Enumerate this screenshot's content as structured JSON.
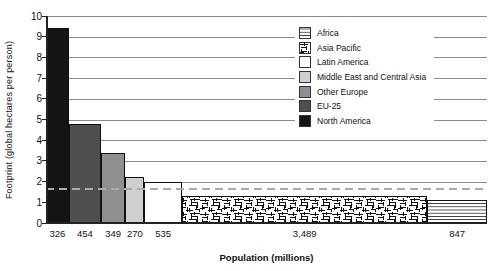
{
  "chart_data": {
    "type": "bar",
    "variant": "variable-width-bars",
    "xlabel": "Population (millions)",
    "ylabel": "Footprint (global hectares per person)",
    "ylim": [
      0,
      10
    ],
    "ytick_interval": 1,
    "grid": "horizontal",
    "legend_position": "top-right-inside",
    "reference_line": {
      "value": 1.7,
      "style": "dashed",
      "color": "#aaaaaa"
    },
    "axis_color": "#222222",
    "gridline_color": "#8c8c8c",
    "bar_border_color": "#111111",
    "series": [
      {
        "region": "North America",
        "population_millions": 326,
        "population_label": "326",
        "footprint_gha_per_person": 9.4,
        "fill": "#141414",
        "pattern": "solid"
      },
      {
        "region": "EU-25",
        "population_millions": 454,
        "population_label": "454",
        "footprint_gha_per_person": 4.8,
        "fill": "#4f4f4f",
        "pattern": "solid"
      },
      {
        "region": "Other Europe",
        "population_millions": 349,
        "population_label": "349",
        "footprint_gha_per_person": 3.4,
        "fill": "#8f8f8f",
        "pattern": "solid"
      },
      {
        "region": "Middle East and Central Asia",
        "population_millions": 270,
        "population_label": "270",
        "footprint_gha_per_person": 2.2,
        "fill": "#cfcfcf",
        "pattern": "solid"
      },
      {
        "region": "Latin America",
        "population_millions": 535,
        "population_label": "535",
        "footprint_gha_per_person": 2.0,
        "fill": "#ffffff",
        "pattern": "solid"
      },
      {
        "region": "Asia Pacific",
        "population_millions": 3489,
        "population_label": "3,489",
        "footprint_gha_per_person": 1.3,
        "fill": "#ffffff",
        "pattern": "maze"
      },
      {
        "region": "Africa",
        "population_millions": 847,
        "population_label": "847",
        "footprint_gha_per_person": 1.1,
        "fill": "#ffffff",
        "pattern": "hlines"
      }
    ],
    "legend": {
      "items": [
        "Africa",
        "Asia Pacific",
        "Latin America",
        "Middle East and Central Asia",
        "Other Europe",
        "EU-25",
        "North America"
      ]
    }
  }
}
